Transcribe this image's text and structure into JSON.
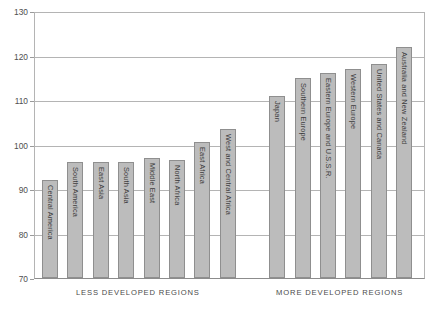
{
  "chart_data": {
    "type": "bar",
    "title": "",
    "subtitle": "",
    "xlabel": "",
    "ylabel": "",
    "ylim": [
      70,
      130
    ],
    "yticks": [
      70,
      80,
      90,
      100,
      110,
      120,
      130
    ],
    "grid": true,
    "legend": null,
    "bar_color": "#bcbcbc",
    "bar_border_color": "#8f8f8f",
    "grid_color": "#b4b4b4",
    "categories": [
      "Central America",
      "South America",
      "East Asia",
      "South Asia",
      "Middle East",
      "North Africa",
      "East Africa",
      "West and Central Africa",
      "Japan",
      "Southern Europe",
      "Eastern Europe and U.S.S.R.",
      "Western Europe",
      "United States and Canada",
      "Australia and New Zealand"
    ],
    "values": [
      92,
      96,
      96,
      96,
      97,
      96.5,
      100.5,
      103.5,
      111,
      115,
      116,
      117,
      118,
      122
    ],
    "groups": [
      {
        "label": "LESS DEVELOPED REGIONS",
        "start": 0,
        "end": 7
      },
      {
        "label": "MORE DEVELOPED REGIONS",
        "start": 8,
        "end": 13
      }
    ]
  }
}
